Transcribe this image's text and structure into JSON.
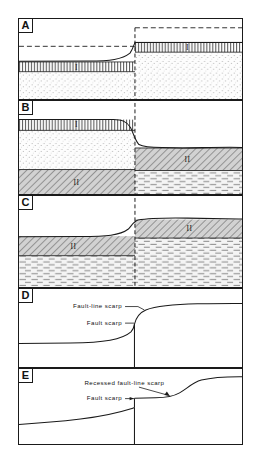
{
  "figure": {
    "panel_count": 5,
    "fault_x_fraction": 0.52,
    "colors": {
      "ink": "#1a1a1a",
      "hatch": "#555555",
      "stipple": "#9a9a9a",
      "shale_fill": "#c9c9c9",
      "background": "#ffffff"
    }
  },
  "panels": [
    {
      "id": "A",
      "label": "A",
      "stage": "initial-displacement",
      "units": [
        {
          "name": "I",
          "pattern": "vertical-hatch",
          "side": "left"
        },
        {
          "name": "I",
          "pattern": "vertical-hatch",
          "side": "right"
        },
        {
          "name": "stipple",
          "pattern": "stipple",
          "side": "both"
        }
      ],
      "dashed_datums": 2,
      "annotations": []
    },
    {
      "id": "B",
      "label": "B",
      "stage": "erosion-of-upthrown-block",
      "units": [
        {
          "name": "I",
          "pattern": "vertical-hatch",
          "side": "left"
        },
        {
          "name": "stipple",
          "pattern": "stipple",
          "side": "left"
        },
        {
          "name": "II",
          "pattern": "diagonal-hatch",
          "side": "left"
        },
        {
          "name": "II",
          "pattern": "diagonal-hatch",
          "side": "right"
        },
        {
          "name": "dash-brick",
          "pattern": "dash-brick",
          "side": "right"
        }
      ],
      "dashed_datums": 1,
      "annotations": []
    },
    {
      "id": "C",
      "label": "C",
      "stage": "further-erosion-resistant-unit-exposed",
      "units": [
        {
          "name": "II",
          "pattern": "diagonal-hatch",
          "side": "left"
        },
        {
          "name": "dash-brick",
          "pattern": "dash-brick",
          "side": "left"
        },
        {
          "name": "II",
          "pattern": "diagonal-hatch",
          "side": "right"
        },
        {
          "name": "dash-brick",
          "pattern": "dash-brick",
          "side": "right"
        }
      ],
      "dashed_datums": 1,
      "annotations": []
    },
    {
      "id": "D",
      "label": "D",
      "stage": "fault-line-scarp-profile",
      "units": [],
      "dashed_datums": 0,
      "annotations": [
        {
          "text": "Fault-line scarp",
          "leader": true
        },
        {
          "text": "Fault scarp",
          "leader": true
        }
      ]
    },
    {
      "id": "E",
      "label": "E",
      "stage": "recessed-fault-line-scarp-profile",
      "units": [],
      "dashed_datums": 0,
      "annotations": [
        {
          "text": "Recessed fault-line scarp",
          "leader": true
        },
        {
          "text": "Fault scarp",
          "leader": true
        }
      ]
    }
  ],
  "labels": {
    "unit_one": "I",
    "unit_two": "II",
    "fault_line_scarp": "Fault-line scarp",
    "fault_scarp": "Fault scarp",
    "recessed_fault_line_scarp": "Recessed fault-line scarp",
    "panel_a": "A",
    "panel_b": "B",
    "panel_c": "C",
    "panel_d": "D",
    "panel_e": "E"
  }
}
